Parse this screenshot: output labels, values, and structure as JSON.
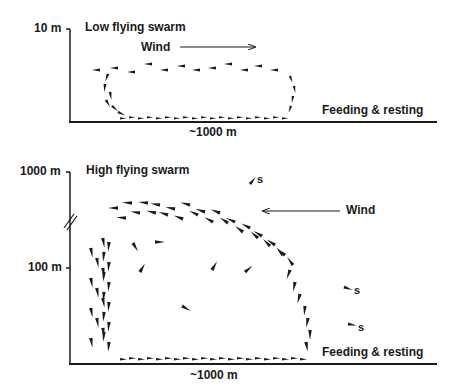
{
  "panels": [
    {
      "title": "Low flying swarm",
      "y_top_label": "10 m",
      "x_label": "~1000 m",
      "wind_label": "Wind",
      "wind_direction": "right",
      "ground_label": "Feeding & resting"
    },
    {
      "title": "High flying swarm",
      "y_top_label": "1000 m",
      "y_mid_label": "100 m",
      "x_label": "~1000 m",
      "wind_label": "Wind",
      "wind_direction": "left",
      "ground_label": "Feeding & resting",
      "straggler_label": "s",
      "axis_break": true
    }
  ],
  "colors": {
    "ink": "#1a1a1a",
    "background": "#ffffff"
  }
}
